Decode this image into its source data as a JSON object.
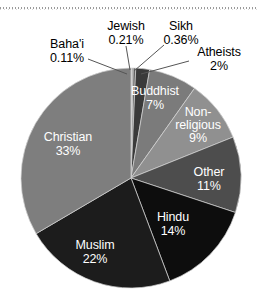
{
  "chart_data": {
    "type": "pie",
    "title": "",
    "subtitle": "",
    "xlabel": "",
    "ylabel": "",
    "legend_position": "none",
    "grid": false,
    "label_format": "name + percent",
    "start_angle_deg": 0,
    "direction": "clockwise",
    "categories": [
      "Baha'i",
      "Jewish",
      "Sikh",
      "Atheists",
      "Buddhist",
      "Non-religious",
      "Other",
      "Hindu",
      "Muslim",
      "Christian"
    ],
    "values": [
      0.11,
      0.21,
      0.36,
      2,
      7,
      9,
      11,
      14,
      22,
      33
    ],
    "value_labels": [
      "0.11%",
      "0.21%",
      "0.36%",
      "2%",
      "7%",
      "9%",
      "11%",
      "14%",
      "22%",
      "33%"
    ],
    "colors": [
      "#b4b4b4",
      "#8f8f8f",
      "#636363",
      "#3a3a3a",
      "#7b7b7b",
      "#909090",
      "#4d4d4d",
      "#0d0d0d",
      "#1c1c1c",
      "#7e7e7e"
    ],
    "slices": [
      {
        "name": "Baha'i",
        "percent": 0.11,
        "label": "0.11%",
        "color": "#b4b4b4",
        "label_placement": "outside"
      },
      {
        "name": "Jewish",
        "percent": 0.21,
        "label": "0.21%",
        "color": "#8f8f8f",
        "label_placement": "outside"
      },
      {
        "name": "Sikh",
        "percent": 0.36,
        "label": "0.36%",
        "color": "#636363",
        "label_placement": "outside"
      },
      {
        "name": "Atheists",
        "percent": 2,
        "label": "2%",
        "color": "#3a3a3a",
        "label_placement": "outside"
      },
      {
        "name": "Buddhist",
        "percent": 7,
        "label": "7%",
        "color": "#7b7b7b",
        "label_placement": "inside"
      },
      {
        "name": "Non-religious",
        "percent": 9,
        "label": "9%",
        "color": "#909090",
        "label_placement": "inside"
      },
      {
        "name": "Other",
        "percent": 11,
        "label": "11%",
        "color": "#4d4d4d",
        "label_placement": "inside"
      },
      {
        "name": "Hindu",
        "percent": 14,
        "label": "14%",
        "color": "#0d0d0d",
        "label_placement": "inside"
      },
      {
        "name": "Muslim",
        "percent": 22,
        "label": "22%",
        "color": "#1c1c1c",
        "label_placement": "inside"
      },
      {
        "name": "Christian",
        "percent": 33,
        "label": "33%",
        "color": "#7e7e7e",
        "label_placement": "inside"
      }
    ]
  },
  "labels": {
    "bahai": {
      "name": "Baha'i",
      "pct": "0.11%"
    },
    "jewish": {
      "name": "Jewish",
      "pct": "0.21%"
    },
    "sikh": {
      "name": "Sikh",
      "pct": "0.36%"
    },
    "atheists": {
      "name": "Atheists",
      "pct": "2%"
    },
    "buddhist": {
      "name": "Buddhist",
      "pct": "7%"
    },
    "nonreligious": {
      "line1": "Non-",
      "line2": "religious",
      "pct": "9%"
    },
    "other": {
      "name": "Other",
      "pct": "11%"
    },
    "hindu": {
      "name": "Hindu",
      "pct": "14%"
    },
    "muslim": {
      "name": "Muslim",
      "pct": "22%"
    },
    "christian": {
      "name": "Christian",
      "pct": "33%"
    }
  },
  "theme": {
    "background": "#ffffff",
    "label_text_inside": "#ffffff",
    "label_text_outside": "#000000",
    "leader_line": "#555555"
  }
}
